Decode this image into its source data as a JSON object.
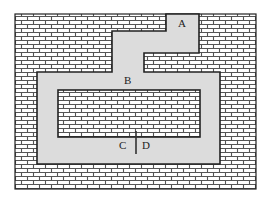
{
  "diagram": {
    "title": "",
    "labels": {
      "a": "A",
      "b": "B",
      "c": "C",
      "d": "D"
    },
    "colors": {
      "brick_fill": "#ffffff",
      "mortar": "#555555",
      "corridor": "#dcdcdc",
      "outline": "#222222"
    },
    "regions": [
      {
        "id": "A",
        "type": "entrance"
      },
      {
        "id": "B",
        "type": "loop-corridor"
      },
      {
        "id": "C",
        "type": "left-of-barrier"
      },
      {
        "id": "D",
        "type": "right-of-barrier"
      }
    ]
  }
}
